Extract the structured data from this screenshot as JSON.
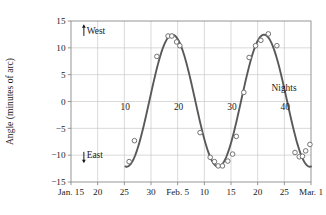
{
  "chart_data": {
    "type": "scatter",
    "title": "",
    "xlabel": "",
    "ylabel": "Angle (minutes of arc)",
    "ylim": [
      -15,
      15
    ],
    "yticks": [
      15,
      10,
      5,
      0,
      -5,
      -10,
      -15
    ],
    "ytick_labels": [
      "15",
      "10",
      "5",
      "0",
      "−5",
      "−10",
      "−15"
    ],
    "xlim": [
      0,
      45
    ],
    "xticks": [
      0,
      5,
      10,
      15,
      20,
      25,
      30,
      35,
      40,
      45
    ],
    "xtick_labels": [
      "Jan. 15",
      "20",
      "25",
      "30",
      "Feb. 5",
      "10",
      "15",
      "20",
      "25",
      "Mar. 1"
    ],
    "grid": true,
    "legend": "none",
    "series": [
      {
        "name": "fitted sinusoid",
        "kind": "line",
        "color": "#595959",
        "amplitude": 12.3,
        "period": 17.2,
        "phase_night": 19.0,
        "offset": 0.15
      },
      {
        "name": "observations",
        "kind": "markers",
        "marker": "open-circle",
        "color": "#6b6b6b",
        "points": [
          {
            "night": 10.9,
            "angle": -11.2
          },
          {
            "night": 11.9,
            "angle": -7.3
          },
          {
            "night": 16.1,
            "angle": 8.4
          },
          {
            "night": 18.2,
            "angle": 12.2
          },
          {
            "night": 18.9,
            "angle": 12.2
          },
          {
            "night": 19.8,
            "angle": 11.1
          },
          {
            "night": 20.4,
            "angle": 10.4
          },
          {
            "night": 24.2,
            "angle": -5.8
          },
          {
            "night": 26.1,
            "angle": -10.4
          },
          {
            "night": 26.9,
            "angle": -11.2
          },
          {
            "night": 27.6,
            "angle": -12.0
          },
          {
            "night": 28.4,
            "angle": -12.0
          },
          {
            "night": 29.4,
            "angle": -11.1
          },
          {
            "night": 30.3,
            "angle": -9.8
          },
          {
            "night": 31.0,
            "angle": -6.5
          },
          {
            "night": 32.4,
            "angle": 1.7
          },
          {
            "night": 33.4,
            "angle": 8.2
          },
          {
            "night": 34.6,
            "angle": 10.4
          },
          {
            "night": 35.6,
            "angle": 11.4
          },
          {
            "night": 37.0,
            "angle": 12.6
          },
          {
            "night": 38.6,
            "angle": 10.4
          },
          {
            "night": 42.0,
            "angle": -9.5
          },
          {
            "night": 42.8,
            "angle": -10.3
          },
          {
            "night": 43.4,
            "angle": -10.2
          },
          {
            "night": 44.0,
            "angle": -9.2
          },
          {
            "night": 44.8,
            "angle": -8.0
          }
        ]
      }
    ],
    "annotations": [
      {
        "name": "west-direction",
        "text": "West",
        "night": 2.0,
        "angle": 12.6
      },
      {
        "name": "east-direction",
        "text": "East",
        "night": 2.0,
        "angle": -10.6
      },
      {
        "name": "nights-axis-label",
        "text": "Nights",
        "night": 37.6,
        "angle": 1.9
      },
      {
        "name": "night-count-10",
        "text": "10",
        "night": 9.3,
        "angle": -1.6
      },
      {
        "name": "night-count-20",
        "text": "20",
        "night": 19.3,
        "angle": -1.6
      },
      {
        "name": "night-count-30",
        "text": "30",
        "night": 29.3,
        "angle": -1.6
      },
      {
        "name": "night-count-40",
        "text": "40",
        "night": 39.3,
        "angle": -1.6
      }
    ],
    "colors": {
      "curve": "#595959",
      "marker_edge": "#6b6b6b",
      "marker_fill": "#ffffff",
      "grid": "#c8c8c8",
      "frame": "#8a8a8a",
      "text": "#1a1a1a",
      "background": "#ffffff"
    }
  }
}
